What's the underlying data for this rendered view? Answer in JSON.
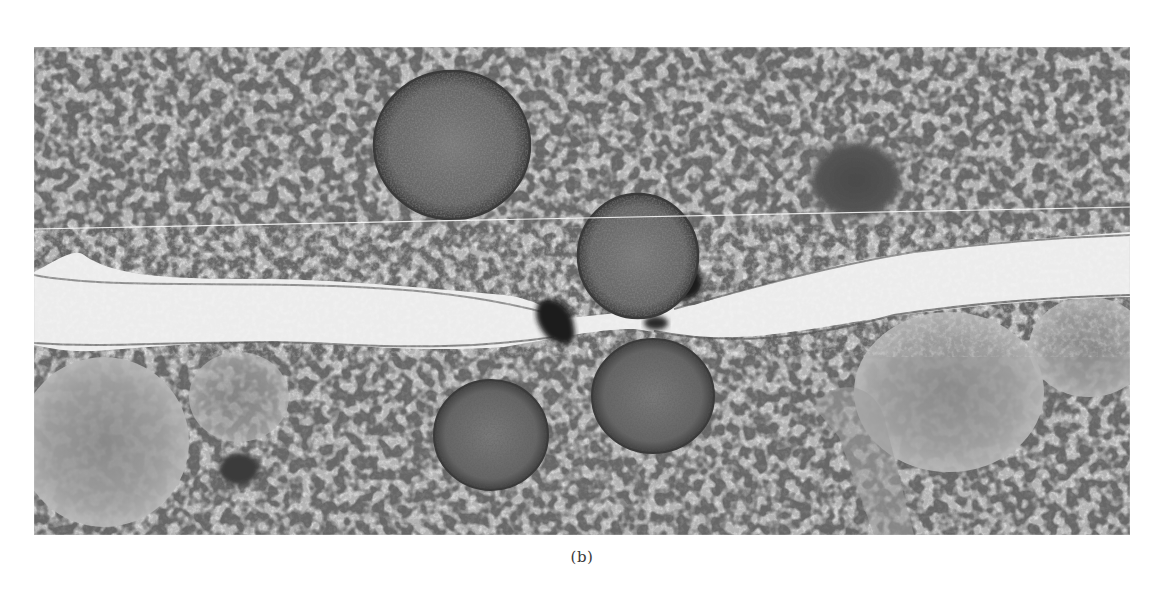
{
  "figure": {
    "panel_label": "(b)",
    "image": {
      "kind": "electron micrograph (grayscale)",
      "description": "Two adjacent cells separated by a pale intercellular cleft running horizontally; dense-core/round vesicles clustered at a junction with dark membrane densities; granular cytoplasm above and below.",
      "features": [
        {
          "name": "large-round-vesicle-top",
          "shape": "circle"
        },
        {
          "name": "dark-granule-top-right",
          "shape": "circle"
        },
        {
          "name": "vesicle-at-junction",
          "shape": "circle"
        },
        {
          "name": "vesicle-lower-left",
          "shape": "circle"
        },
        {
          "name": "vesicle-lower-center",
          "shape": "circle"
        },
        {
          "name": "pale-intercellular-cleft",
          "shape": "band"
        },
        {
          "name": "dark-junction-densities",
          "shape": "blobs"
        },
        {
          "name": "pale-mitochondrion-left",
          "shape": "ellipse"
        },
        {
          "name": "pale-mitochondrion-right",
          "shape": "ellipse"
        }
      ],
      "colors": {
        "background_page": "#ffffff",
        "cytoplasm_mid": "#a9a9a9",
        "cleft_pale": "#e6e6e6",
        "vesicle_fill": "#6e6e6e",
        "junction_dark": "#1c1c1c"
      }
    }
  }
}
